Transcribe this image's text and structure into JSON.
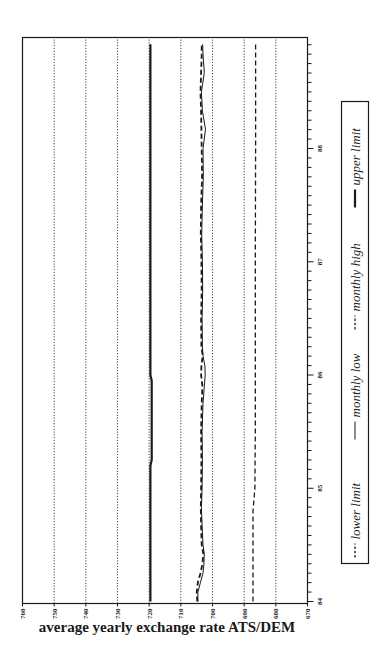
{
  "chart_data": {
    "type": "line",
    "title": "",
    "xlabel": "",
    "ylabel": "average yearly exchange rate ATS/DEM",
    "orientation": "rotated 90° counter-clockwise (years run upward along right edge, rate increases leftward)",
    "xlim": [
      84,
      89
    ],
    "ylim": [
      670,
      760
    ],
    "x_ticks": [
      "84",
      "85",
      "86",
      "87",
      "88"
    ],
    "x_minor_ticks_per_year": 12,
    "y_ticks": [
      670,
      680,
      690,
      700,
      710,
      720,
      730,
      740,
      750,
      760
    ],
    "grid": {
      "horizontal": true,
      "style": "dotted"
    },
    "legend": {
      "position": "below plot (right side of rotated image)",
      "entries": [
        "lower limit",
        "monthly low",
        "monthly high",
        "upper limit"
      ]
    },
    "series": [
      {
        "name": "lower limit",
        "style": "dashed",
        "x": [
          84.0,
          84.8,
          85.0,
          85.5,
          86.0,
          87.0,
          88.0,
          88.92
        ],
        "values": [
          687.2,
          687.2,
          686.6,
          686.5,
          686.5,
          686.5,
          686.4,
          686.4
        ]
      },
      {
        "name": "monthly low",
        "style": "solid",
        "x": [
          84.0,
          84.08,
          84.17,
          84.25,
          84.33,
          84.42,
          84.5,
          84.67,
          84.83,
          85.0,
          85.25,
          85.5,
          85.75,
          85.9,
          86.0,
          86.08,
          86.17,
          86.25,
          86.5,
          86.75,
          87.0,
          87.25,
          87.5,
          87.75,
          88.0,
          88.17,
          88.33,
          88.5,
          88.67,
          88.83,
          88.92
        ],
        "values": [
          704.6,
          704.6,
          703.8,
          703.0,
          702.7,
          702.6,
          703.0,
          703.3,
          703.5,
          703.3,
          703.2,
          703.3,
          703.0,
          702.6,
          702.3,
          702.4,
          703.0,
          703.2,
          703.3,
          703.1,
          703.2,
          703.4,
          703.2,
          702.9,
          703.0,
          702.2,
          703.2,
          703.5,
          702.6,
          703.0,
          703.1
        ]
      },
      {
        "name": "monthly high",
        "style": "dashed",
        "x": [
          84.0,
          84.08,
          84.17,
          84.25,
          84.33,
          84.42,
          84.5,
          84.67,
          84.83,
          85.0,
          85.25,
          85.5,
          85.75,
          85.9,
          86.0,
          86.08,
          86.17,
          86.25,
          86.5,
          86.75,
          87.0,
          87.25,
          87.5,
          87.75,
          88.0,
          88.17,
          88.33,
          88.5,
          88.67,
          88.83,
          88.92
        ],
        "values": [
          704.8,
          705.0,
          704.6,
          703.8,
          703.2,
          702.9,
          703.4,
          703.6,
          703.7,
          703.6,
          703.5,
          703.6,
          703.4,
          703.2,
          703.6,
          703.5,
          703.1,
          703.5,
          703.6,
          703.4,
          703.5,
          703.7,
          703.6,
          703.3,
          703.4,
          703.5,
          703.6,
          703.8,
          703.6,
          703.4,
          703.4
        ]
      },
      {
        "name": "upper limit",
        "style": "solid-bold",
        "x": [
          84.0,
          85.2,
          85.25,
          85.95,
          86.0,
          87.0,
          88.0,
          88.92
        ],
        "values": [
          719.6,
          719.6,
          719.2,
          719.2,
          719.6,
          719.6,
          719.6,
          719.6
        ]
      }
    ]
  },
  "colors": {
    "ink": "#1a1a1a",
    "grid": "#555555",
    "background": "#ffffff"
  }
}
